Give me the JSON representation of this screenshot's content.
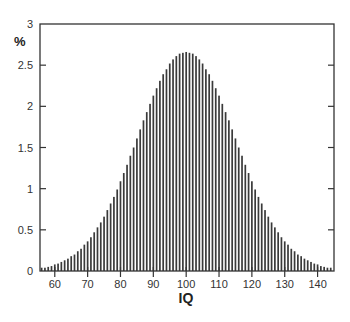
{
  "chart_data": {
    "type": "bar",
    "title": "",
    "xlabel": "IQ",
    "ylabel": "%",
    "xlim": [
      55.5,
      145
    ],
    "ylim": [
      0,
      3
    ],
    "grid": false,
    "legend": null,
    "xticks": [
      60,
      70,
      80,
      90,
      100,
      110,
      120,
      130,
      140
    ],
    "yticks": [
      0,
      0.5,
      1,
      1.5,
      2,
      2.5,
      3
    ],
    "ytick_labels": [
      "0",
      "0.5",
      "1",
      "1.5",
      "2",
      "2.5",
      "3"
    ],
    "x": [
      56,
      57,
      58,
      59,
      60,
      61,
      62,
      63,
      64,
      65,
      66,
      67,
      68,
      69,
      70,
      71,
      72,
      73,
      74,
      75,
      76,
      77,
      78,
      79,
      80,
      81,
      82,
      83,
      84,
      85,
      86,
      87,
      88,
      89,
      90,
      91,
      92,
      93,
      94,
      95,
      96,
      97,
      98,
      99,
      100,
      101,
      102,
      103,
      104,
      105,
      106,
      107,
      108,
      109,
      110,
      111,
      112,
      113,
      114,
      115,
      116,
      117,
      118,
      119,
      120,
      121,
      122,
      123,
      124,
      125,
      126,
      127,
      128,
      129,
      130,
      131,
      132,
      133,
      134,
      135,
      136,
      137,
      138,
      139,
      140,
      141,
      142,
      143,
      144
    ],
    "values": [
      0.04,
      0.04,
      0.05,
      0.06,
      0.08,
      0.09,
      0.11,
      0.13,
      0.15,
      0.18,
      0.2,
      0.24,
      0.27,
      0.32,
      0.36,
      0.41,
      0.47,
      0.53,
      0.59,
      0.66,
      0.74,
      0.82,
      0.9,
      0.99,
      1.09,
      1.19,
      1.29,
      1.4,
      1.5,
      1.61,
      1.72,
      1.83,
      1.93,
      2.03,
      2.13,
      2.22,
      2.31,
      2.39,
      2.45,
      2.52,
      2.57,
      2.61,
      2.64,
      2.65,
      2.66,
      2.65,
      2.64,
      2.61,
      2.57,
      2.52,
      2.45,
      2.39,
      2.31,
      2.22,
      2.13,
      2.03,
      1.93,
      1.83,
      1.72,
      1.61,
      1.5,
      1.4,
      1.29,
      1.19,
      1.09,
      0.99,
      0.9,
      0.82,
      0.74,
      0.66,
      0.59,
      0.53,
      0.47,
      0.41,
      0.36,
      0.32,
      0.27,
      0.24,
      0.2,
      0.18,
      0.15,
      0.13,
      0.11,
      0.09,
      0.08,
      0.06,
      0.05,
      0.04,
      0.04
    ]
  },
  "colors": {
    "bar": "#3a3a3a",
    "axis": "#333333",
    "background": "#ffffff"
  }
}
